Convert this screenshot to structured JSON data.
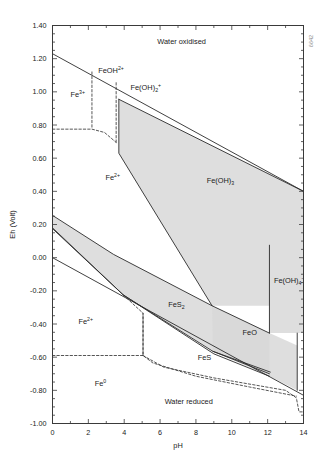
{
  "figure": {
    "side_code": "6642",
    "background": "#ffffff",
    "frame_color": "#3a3a3a",
    "shade_color": "#d8d8d8",
    "line_color": "#2b2b2b"
  },
  "chart_data": {
    "type": "line",
    "title": "",
    "subtitle": "",
    "xlabel": "pH",
    "ylabel": "Eh (Volt)",
    "xlim": [
      0,
      14
    ],
    "ylim": [
      -1.0,
      1.4
    ],
    "grid": false,
    "legend_position": "none",
    "xticks": [
      0,
      2,
      4,
      6,
      8,
      10,
      12,
      14
    ],
    "xtick_labels": [
      "0",
      "2",
      "4",
      "6",
      "8",
      "10",
      "12",
      "14"
    ],
    "xminor_step": 1,
    "yticks": [
      -1.0,
      -0.8,
      -0.6,
      -0.4,
      -0.2,
      0.0,
      0.2,
      0.4,
      0.6,
      0.8,
      1.0,
      1.2,
      1.4
    ],
    "ytick_labels": [
      "-1.00",
      "-0.80",
      "-0.60",
      "-0.40",
      "-0.20",
      "0.00",
      "0.20",
      "0.40",
      "0.60",
      "0.80",
      "1.00",
      "1.20",
      "1.40"
    ],
    "yminor_step": 0.05,
    "annotations": [
      {
        "text": "Water oxidised",
        "x": 7.2,
        "y": 1.29,
        "style": "plain"
      },
      {
        "text": "Water reduced",
        "x": 7.6,
        "y": -0.88,
        "style": "plain"
      },
      {
        "text": "Fe",
        "sup": "3+",
        "x": 1.0,
        "y": 0.97,
        "style": "species"
      },
      {
        "text": "FeOH",
        "sup": "2+",
        "x": 2.55,
        "y": 1.115,
        "style": "species"
      },
      {
        "text": "Fe(OH)",
        "sub": "2",
        "sup": "+",
        "x": 4.35,
        "y": 1.01,
        "style": "species"
      },
      {
        "text": "Fe",
        "sup": "2+",
        "x": 2.95,
        "y": 0.47,
        "style": "species"
      },
      {
        "text": "Fe(OH)",
        "sub": "3",
        "x": 8.6,
        "y": 0.45,
        "style": "species"
      },
      {
        "text": "Fe(OH)",
        "sub": "4",
        "sup": "-",
        "x": 12.35,
        "y": -0.155,
        "style": "species"
      },
      {
        "text": "Fe",
        "sup": "2+",
        "x": 1.45,
        "y": -0.4,
        "style": "species"
      },
      {
        "text": "FeS",
        "sub": "2",
        "x": 6.45,
        "y": -0.295,
        "style": "species"
      },
      {
        "text": "FeO",
        "x": 10.6,
        "y": -0.465,
        "style": "species"
      },
      {
        "text": "FeS",
        "x": 8.1,
        "y": -0.615,
        "style": "species"
      },
      {
        "text": "Fe",
        "sup": "0",
        "x": 2.35,
        "y": -0.775,
        "style": "species"
      }
    ],
    "series": [
      {
        "name": "water-oxidation-upper-limit",
        "kind": "solid-line",
        "points": [
          [
            0,
            1.23
          ],
          [
            14,
            0.4
          ]
        ]
      },
      {
        "name": "water-reduction-lower-limit",
        "kind": "solid-line",
        "points": [
          [
            0,
            0.0
          ],
          [
            14,
            -0.83
          ]
        ]
      },
      {
        "name": "fe3-feoh2-boundary",
        "kind": "dashed-line",
        "points": [
          [
            2.2,
            1.12
          ],
          [
            2.2,
            0.78
          ]
        ]
      },
      {
        "name": "feoh2-feoh2plus-boundary",
        "kind": "dashed-line",
        "points": [
          [
            3.55,
            1.055
          ],
          [
            3.55,
            0.695
          ]
        ]
      },
      {
        "name": "fe3-fe2-boundary",
        "kind": "dashed-line",
        "points": [
          [
            0,
            0.775
          ],
          [
            2.2,
            0.775
          ],
          [
            2.9,
            0.755
          ],
          [
            3.55,
            0.695
          ]
        ]
      },
      {
        "name": "fe2-feoh3-boundary",
        "kind": "solid-line",
        "points": [
          [
            3.7,
            0.955
          ],
          [
            3.7,
            0.63
          ],
          [
            8.9,
            -0.29
          ]
        ]
      },
      {
        "name": "feoh3-upper-right-edge",
        "kind": "solid-line",
        "points": [
          [
            3.7,
            0.955
          ],
          [
            14,
            0.4
          ]
        ]
      },
      {
        "name": "feoh3-feoh4-vertical",
        "kind": "solid-line",
        "points": [
          [
            12.1,
            0.075
          ],
          [
            12.1,
            -0.455
          ]
        ]
      },
      {
        "name": "fes2-upper-boundary",
        "kind": "solid-line",
        "points": [
          [
            0,
            0.255
          ],
          [
            3.4,
            0.02
          ],
          [
            8.9,
            -0.29
          ],
          [
            12.1,
            -0.455
          ]
        ]
      },
      {
        "name": "fes2-lower-boundary",
        "kind": "solid-line",
        "points": [
          [
            0,
            0.175
          ],
          [
            3.95,
            -0.225
          ],
          [
            8.95,
            -0.565
          ],
          [
            12.15,
            -0.69
          ]
        ]
      },
      {
        "name": "fe2-fes2-lower-solid",
        "kind": "solid-line",
        "points": [
          [
            0,
            0.18
          ],
          [
            3.95,
            -0.225
          ],
          [
            9.0,
            -0.58
          ],
          [
            12.1,
            -0.715
          ]
        ]
      },
      {
        "name": "fes-region-lower",
        "kind": "solid-line",
        "points": [
          [
            8.95,
            -0.565
          ],
          [
            12.1,
            -0.7
          ]
        ]
      },
      {
        "name": "fe0-fe2-boundary",
        "kind": "dashed-line",
        "points": [
          [
            0,
            -0.59
          ],
          [
            5.05,
            -0.59
          ],
          [
            5.05,
            -0.335
          ]
        ]
      },
      {
        "name": "fe2-fes2-dashed",
        "kind": "dashed-line",
        "points": [
          [
            3.95,
            -0.225
          ],
          [
            5.05,
            -0.335
          ],
          [
            5.05,
            -0.59
          ],
          [
            5.6,
            -0.635
          ],
          [
            8.0,
            -0.715
          ],
          [
            11.0,
            -0.78
          ],
          [
            13.6,
            -0.835
          ]
        ]
      },
      {
        "name": "fe0-right-dashed",
        "kind": "dashed-line",
        "points": [
          [
            5.05,
            -0.59
          ],
          [
            6.2,
            -0.66
          ],
          [
            9.0,
            -0.725
          ],
          [
            13.0,
            -0.8
          ],
          [
            13.6,
            -0.845
          ],
          [
            13.75,
            -0.93
          ],
          [
            14,
            -0.93
          ]
        ]
      },
      {
        "name": "feoh4-right-vertical",
        "kind": "solid-line",
        "points": [
          [
            13.65,
            -0.455
          ],
          [
            13.65,
            -0.8
          ]
        ]
      }
    ],
    "shaded_regions": [
      {
        "name": "feoh3-stability-field",
        "polygon": [
          [
            3.7,
            0.955
          ],
          [
            14,
            0.4
          ],
          [
            14,
            -0.455
          ],
          [
            12.1,
            -0.455
          ],
          [
            12.1,
            -0.29
          ],
          [
            8.9,
            -0.29
          ],
          [
            3.7,
            0.63
          ]
        ]
      },
      {
        "name": "fes2-stability-field",
        "polygon": [
          [
            0,
            0.255
          ],
          [
            3.4,
            0.02
          ],
          [
            8.9,
            -0.29
          ],
          [
            12.1,
            -0.455
          ],
          [
            12.1,
            -0.69
          ],
          [
            8.95,
            -0.565
          ],
          [
            3.95,
            -0.225
          ],
          [
            0,
            0.175
          ]
        ]
      },
      {
        "name": "feo-fes-wedge",
        "polygon": [
          [
            8.9,
            -0.29
          ],
          [
            12.1,
            -0.455
          ],
          [
            13.65,
            -0.53
          ],
          [
            13.65,
            -0.8
          ],
          [
            12.1,
            -0.715
          ],
          [
            8.95,
            -0.565
          ]
        ]
      }
    ]
  }
}
